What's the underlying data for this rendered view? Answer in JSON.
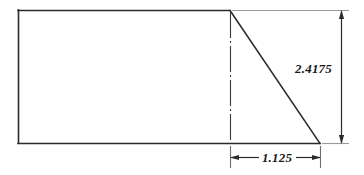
{
  "drawing": {
    "title": "Right trapezoid profile dimensioned drawing",
    "background_color": "#ffffff",
    "line_color": "#2b2b2b",
    "extension_line_color": "#9a9a9a",
    "centerline_color": "#3a3a3a",
    "text_color": "#1a1a1a",
    "geometry": {
      "shape_name": "right-trapezoid",
      "rectangle": {
        "left": 18,
        "top": 10,
        "right": 230,
        "bottom": 143
      },
      "apex": {
        "x": 230,
        "y": 10
      },
      "diagonal_end": {
        "x": 320,
        "y": 143
      },
      "centerline_x": 230
    },
    "dimensions": [
      {
        "id": "height",
        "label": "2.4175",
        "orientation": "vertical",
        "position": "right",
        "line_x": 341,
        "from_y": 10,
        "to_y": 143,
        "text_x": 332,
        "text_y": 73
      },
      {
        "id": "taper-length",
        "label": "1.125",
        "orientation": "horizontal",
        "position": "bottom",
        "line_y": 157,
        "from_x": 230,
        "to_x": 320,
        "text_x": 275,
        "text_y": 161
      }
    ]
  }
}
